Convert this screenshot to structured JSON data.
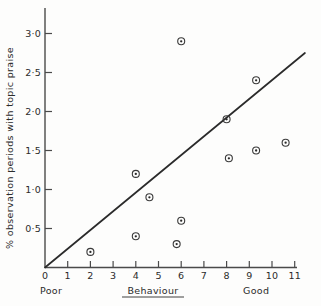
{
  "chart_data": {
    "type": "scatter",
    "title": "",
    "subtitle": "",
    "xlabel": "Behaviour",
    "ylabel": "% observation periods with topic praise",
    "xlim": [
      0,
      12.2
    ],
    "ylim": [
      0,
      3.25
    ],
    "grid": false,
    "legend": null,
    "x_tick_labels": [
      "0",
      "1",
      "2",
      "3",
      "4",
      "5",
      "6",
      "7",
      "8",
      "9",
      "10",
      "11"
    ],
    "x_tick_values": [
      0,
      1,
      2,
      3,
      4,
      5,
      6,
      7,
      8,
      9,
      10,
      11
    ],
    "y_tick_labels": [
      "0·5",
      "1·0",
      "1·5",
      "2·0",
      "2·5",
      "3·0"
    ],
    "y_tick_values": [
      0.5,
      1.0,
      1.5,
      2.0,
      2.5,
      3.0
    ],
    "x_anchor_low": "Poor",
    "x_anchor_high": "Good",
    "points": [
      {
        "x": 2.0,
        "y": 0.2
      },
      {
        "x": 4.0,
        "y": 0.4
      },
      {
        "x": 4.0,
        "y": 1.2
      },
      {
        "x": 4.6,
        "y": 0.9
      },
      {
        "x": 5.8,
        "y": 0.3
      },
      {
        "x": 6.0,
        "y": 0.6
      },
      {
        "x": 6.0,
        "y": 2.9
      },
      {
        "x": 8.0,
        "y": 1.9
      },
      {
        "x": 8.1,
        "y": 1.4
      },
      {
        "x": 9.3,
        "y": 1.5
      },
      {
        "x": 9.3,
        "y": 2.4
      },
      {
        "x": 10.6,
        "y": 1.6
      }
    ],
    "trend_line": {
      "x_start": 0.0,
      "y_start": 0.0,
      "x_end": 11.45,
      "y_end": 2.75
    },
    "colors": {
      "axis": "#4a4a4a",
      "marker": "#3a3a3a",
      "trend": "#2b2b2b",
      "text": "#2b2b2b",
      "background": "#fdfdfc"
    }
  }
}
